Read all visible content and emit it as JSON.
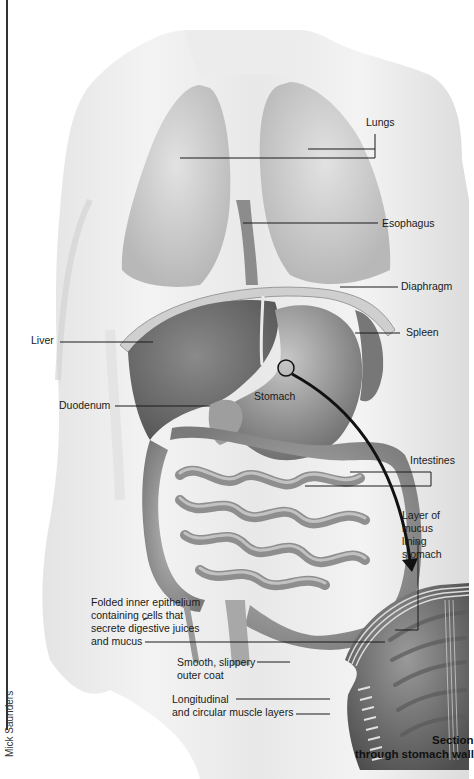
{
  "figure": {
    "title_lines": [
      "Section",
      "through stomach wall"
    ],
    "credit": "Mick Saunders",
    "colors": {
      "background": "#ffffff",
      "skin_light": "#f2f2f2",
      "skin_mid": "#d6d6d6",
      "organ_dark": "#6e6e6e",
      "organ_mid": "#9a9a9a",
      "line": "#1a1a1a"
    }
  },
  "labels": {
    "lungs": "Lungs",
    "esophagus": "Esophagus",
    "diaphragm": "Diaphragm",
    "liver": "Liver",
    "spleen": "Spleen",
    "duodenum": "Duodenum",
    "stomach": "Stomach",
    "intestines": "Intestines",
    "mucus_layer": "Layer of mucus\nlining stomach",
    "inner_epithelium": "Folded inner epithelium\ncontaining cells that\nsecrete digestive juices\nand mucus",
    "outer_coat": "Smooth, slippery\nouter coat",
    "muscle_layers": "Longitudinal\nand circular muscle layers"
  }
}
